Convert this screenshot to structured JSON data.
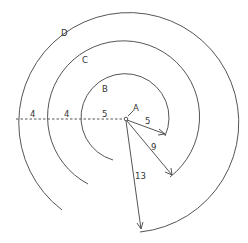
{
  "diagram": {
    "center": {
      "label": "A",
      "x": 126,
      "y": 119
    },
    "curves": [
      {
        "label": "B",
        "radius": 44,
        "radius_value": "5"
      },
      {
        "label": "C",
        "radius": 76,
        "radius_value": "9"
      },
      {
        "label": "D",
        "radius": 110,
        "radius_value": "13"
      }
    ],
    "horizontal_segments": [
      "5",
      "4",
      "4"
    ],
    "radial_arrows": [
      {
        "label": "5",
        "to_curve": "B"
      },
      {
        "label": "9",
        "to_curve": "C"
      },
      {
        "label": "13",
        "to_curve": "D"
      }
    ],
    "colors": {
      "stroke": "#555555",
      "text": "#333333",
      "background": "#ffffff"
    }
  }
}
